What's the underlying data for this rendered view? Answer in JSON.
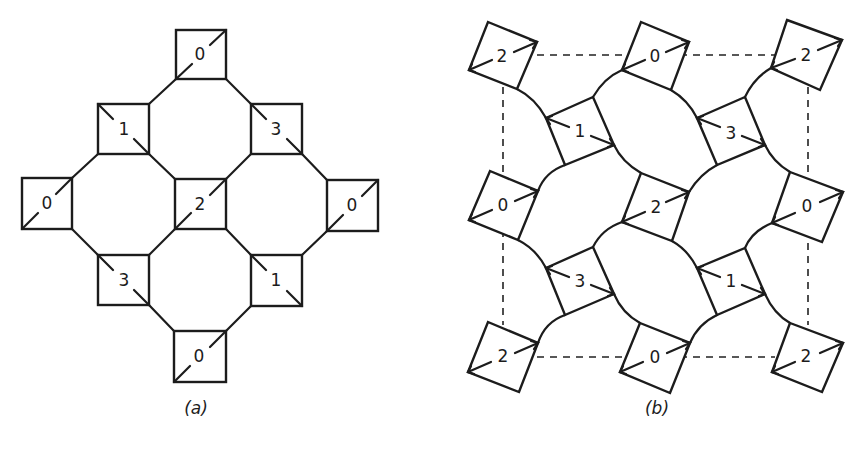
{
  "figure": {
    "panels": [
      {
        "id": "a",
        "caption": "(a)",
        "description": "Octagon-square tiling (4.8.8) with squares labelled 0-3 and a diagonal marker",
        "squares": [
          {
            "label": "0",
            "position": "top"
          },
          {
            "label": "1",
            "position": "upper-left"
          },
          {
            "label": "3",
            "position": "upper-right"
          },
          {
            "label": "0",
            "position": "left"
          },
          {
            "label": "2",
            "position": "center"
          },
          {
            "label": "0",
            "position": "right"
          },
          {
            "label": "3",
            "position": "lower-left"
          },
          {
            "label": "1",
            "position": "lower-right"
          },
          {
            "label": "0",
            "position": "bottom"
          }
        ]
      },
      {
        "id": "b",
        "caption": "(b)",
        "description": "Distorted tiling with rotated squares, arrow markers and a dashed unit cell",
        "squares": [
          {
            "label": "2",
            "position": "top-left"
          },
          {
            "label": "0",
            "position": "top-middle"
          },
          {
            "label": "2",
            "position": "top-right"
          },
          {
            "label": "1",
            "position": "upper-left-inner"
          },
          {
            "label": "3",
            "position": "upper-right-inner"
          },
          {
            "label": "0",
            "position": "middle-left"
          },
          {
            "label": "2",
            "position": "center"
          },
          {
            "label": "0",
            "position": "middle-right"
          },
          {
            "label": "3",
            "position": "lower-left-inner"
          },
          {
            "label": "1",
            "position": "lower-right-inner"
          },
          {
            "label": "2",
            "position": "bottom-left"
          },
          {
            "label": "0",
            "position": "bottom-middle"
          },
          {
            "label": "2",
            "position": "bottom-right"
          }
        ],
        "unit_cell": "dashed"
      }
    ]
  }
}
